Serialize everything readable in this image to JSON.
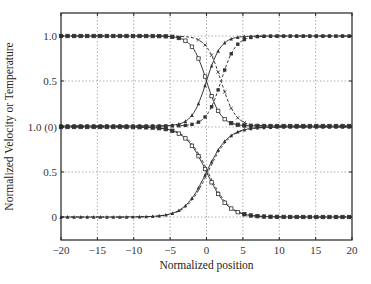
{
  "chart_data": {
    "type": "line",
    "title": "",
    "xlabel": "Normalized position",
    "ylabel": "Normalized Velocity or Temperature",
    "xlim": [
      -20,
      20
    ],
    "x_ticks": [
      -20,
      -15,
      -10,
      -5,
      0,
      5,
      10,
      15,
      20
    ],
    "x_tick_labels": [
      "−20",
      "−15",
      "−10",
      "−5",
      "0",
      "5",
      "10",
      "15",
      "20"
    ],
    "y_tick_labels": [
      "1.0",
      "0.5",
      "1.0 (0)",
      "0.5",
      "0"
    ],
    "grid": true,
    "legend": "none",
    "panels": [
      {
        "name": "upper",
        "ylim": [
          0,
          1
        ],
        "series": [
          {
            "name": "falling-solid",
            "line": "solid",
            "marker": "open-square",
            "profile": "tanh",
            "center": 0,
            "width": 2.0,
            "from": 1,
            "to": 0
          },
          {
            "name": "falling-dashed",
            "line": "dashed",
            "marker": "x",
            "profile": "tanh",
            "center": 2,
            "width": 2.0,
            "from": 1,
            "to": 0
          },
          {
            "name": "rising-solid",
            "line": "solid",
            "marker": "triangle",
            "profile": "tanh",
            "center": 0,
            "width": 2.0,
            "from": 0,
            "to": 1
          },
          {
            "name": "rising-dashed",
            "line": "dashed",
            "marker": "filled-square",
            "profile": "tanh",
            "center": 2,
            "width": 2.0,
            "from": 0,
            "to": 1
          }
        ]
      },
      {
        "name": "lower",
        "ylim": [
          0,
          1
        ],
        "series": [
          {
            "name": "falling-solid",
            "line": "solid",
            "marker": "open-square",
            "profile": "tanh",
            "center": 0,
            "width": 3.0,
            "from": 1,
            "to": 0
          },
          {
            "name": "falling-dashed",
            "line": "dashed",
            "marker": "none",
            "profile": "tanh",
            "center": 0.2,
            "width": 3.0,
            "from": 1,
            "to": 0
          },
          {
            "name": "rising-solid",
            "line": "solid",
            "marker": "filled-triangle",
            "profile": "tanh",
            "center": 0,
            "width": 3.0,
            "from": 0,
            "to": 1
          },
          {
            "name": "rising-dashed",
            "line": "dashed",
            "marker": "none",
            "profile": "tanh",
            "center": 0.2,
            "width": 3.0,
            "from": 0,
            "to": 1
          }
        ]
      }
    ],
    "sample_values": {
      "x": [
        -20,
        -10,
        -5,
        -2,
        0,
        2,
        5,
        10,
        20
      ],
      "upper_falling_solid": [
        1.0,
        1.0,
        0.99,
        0.88,
        0.5,
        0.12,
        0.01,
        0.0,
        0.0
      ],
      "upper_rising_solid": [
        0.0,
        0.0,
        0.01,
        0.12,
        0.5,
        0.88,
        0.99,
        1.0,
        1.0
      ],
      "lower_falling": [
        1.0,
        1.0,
        0.97,
        0.79,
        0.5,
        0.21,
        0.03,
        0.0,
        0.0
      ],
      "lower_rising": [
        0.0,
        0.0,
        0.03,
        0.21,
        0.5,
        0.79,
        0.97,
        1.0,
        1.0
      ]
    }
  },
  "layout": {
    "plot": {
      "left": 61,
      "right": 352,
      "top": 13,
      "bottom": 240
    },
    "upper_panel_px": {
      "y1": 36,
      "y0": 126
    },
    "lower_panel_px": {
      "y1": 127,
      "y0": 217
    },
    "colors": {
      "line": "#222222",
      "grid": "#9a9a9a",
      "marker": "#333333"
    }
  }
}
